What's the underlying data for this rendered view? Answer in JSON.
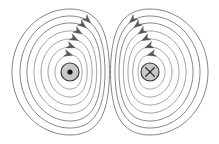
{
  "figure": {
    "width": 219,
    "height": 144,
    "background_color": "#ffffff",
    "line_color": "#8e8e8e",
    "arrow_color": "#5a5a5a",
    "marker_fill_color": "#c9c9c9",
    "marker_stroke_color": "#3a3a3a"
  },
  "wires": [
    {
      "id": "left-wire",
      "label": "current out of page",
      "symbol": "dot",
      "symbol_glyph": "⊙",
      "center_x": 70,
      "center_y": 72,
      "marker_radius": 9,
      "inner_dot_radius": 2.6,
      "field_direction": "counterclockwise",
      "loop_count": 7
    },
    {
      "id": "right-wire",
      "label": "current into page",
      "symbol": "cross",
      "symbol_glyph": "⊗",
      "center_x": 150,
      "center_y": 72,
      "marker_radius": 9,
      "cross_arm": 4.4,
      "field_direction": "clockwise",
      "loop_count": 7
    }
  ],
  "left_loops": [
    {
      "rx": 15,
      "ry": 17,
      "squash": 0.8,
      "arrow": true,
      "arrow_t": 0.78
    },
    {
      "rx": 22,
      "ry": 25,
      "squash": 0.78,
      "arrow": true,
      "arrow_t": 0.79
    },
    {
      "rx": 29,
      "ry": 33,
      "squash": 0.76,
      "arrow": true,
      "arrow_t": 0.8
    },
    {
      "rx": 36,
      "ry": 41,
      "squash": 0.74,
      "arrow": true,
      "arrow_t": 0.81
    },
    {
      "rx": 43,
      "ry": 49,
      "squash": 0.72,
      "arrow": true,
      "arrow_t": 0.82
    },
    {
      "rx": 50,
      "ry": 56,
      "squash": 0.7,
      "arrow": true,
      "arrow_t": 0.83
    },
    {
      "rx": 58,
      "ry": 63,
      "squash": 0.68,
      "arrow": false,
      "arrow_t": 0.84
    }
  ],
  "right_loops": [
    {
      "rx": 15,
      "ry": 17,
      "squash": 0.8,
      "arrow": true,
      "arrow_t": 0.78
    },
    {
      "rx": 22,
      "ry": 25,
      "squash": 0.78,
      "arrow": true,
      "arrow_t": 0.79
    },
    {
      "rx": 29,
      "ry": 33,
      "squash": 0.76,
      "arrow": true,
      "arrow_t": 0.8
    },
    {
      "rx": 36,
      "ry": 41,
      "squash": 0.74,
      "arrow": true,
      "arrow_t": 0.81
    },
    {
      "rx": 43,
      "ry": 49,
      "squash": 0.72,
      "arrow": true,
      "arrow_t": 0.82
    },
    {
      "rx": 50,
      "ry": 56,
      "squash": 0.7,
      "arrow": true,
      "arrow_t": 0.83
    },
    {
      "rx": 58,
      "ry": 63,
      "squash": 0.68,
      "arrow": false,
      "arrow_t": 0.84
    }
  ]
}
